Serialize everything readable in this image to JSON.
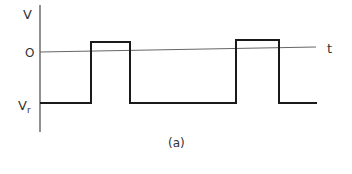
{
  "figure": {
    "caption": "(a)",
    "axis_labels": {
      "y": "V",
      "x": "t",
      "zero": "O",
      "low_level_main": "V",
      "low_level_sub": "r"
    },
    "colors": {
      "waveform": "#1a1a1a",
      "axis": "#555555",
      "text": "#333333"
    },
    "waveform": {
      "type": "rectangular pulse train",
      "levels": [
        "Vr (negative low level)",
        "slightly above 0 (high level)"
      ],
      "pulses": [
        {
          "rise_x": 91,
          "fall_x": 130
        },
        {
          "rise_x": 236,
          "fall_x": 279
        }
      ]
    }
  }
}
